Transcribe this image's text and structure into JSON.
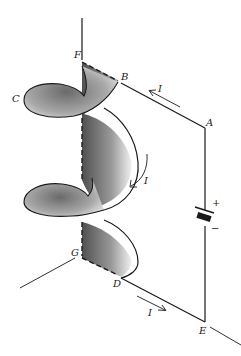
{
  "figure": {
    "type": "circuit-diagram",
    "points": {
      "A": "A",
      "B": "B",
      "C": "C",
      "D": "D",
      "E": "E",
      "F": "F",
      "G": "G"
    },
    "current_labels": {
      "top": "I",
      "middle": "I",
      "bottom": "I"
    },
    "battery": {
      "positive": "+",
      "negative": "−"
    },
    "colors": {
      "ink": "#1a1a1a",
      "shade_dark": "#555555",
      "shade_light": "#e6e6e6",
      "background": "#ffffff"
    }
  }
}
